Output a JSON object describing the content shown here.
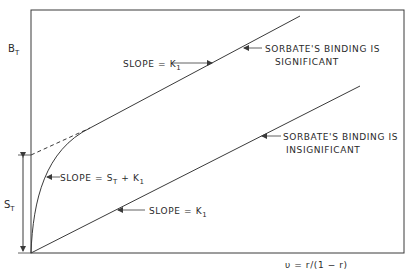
{
  "diagram": {
    "y_axis_label": {
      "main": "B",
      "sub": "T"
    },
    "x_axis_label": "υ = r/(1 − r)",
    "intercept_label": {
      "main": "S",
      "sub": "T"
    },
    "annotations": {
      "upper_slope": {
        "main": "SLOPE = K",
        "sub": "1"
      },
      "curve_slope": {
        "main": "SLOPE = S",
        "sub1": "T",
        "mid": " + K",
        "sub2": "1"
      },
      "lower_slope": {
        "main": "SLOPE = K",
        "sub": "1"
      },
      "significant_line1": "SORBATE'S BINDING IS",
      "significant_line2": "SIGNIFICANT",
      "insignificant_line1": "SORBATE'S BINDING IS",
      "insignificant_line2": "INSIGNIFICANT"
    },
    "colors": {
      "line": "#3a3a3a",
      "background": "#ffffff"
    }
  }
}
